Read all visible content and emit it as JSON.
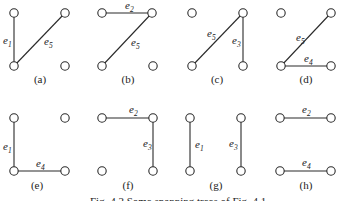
{
  "figure": {
    "caption": "Fig. 4.2   Some spanning trees of Fig. 4.1",
    "edge_color": "#2a2a2a",
    "panels": [
      {
        "label": "(a)",
        "nodes": [
          [
            14,
            13
          ],
          [
            65,
            13
          ],
          [
            14,
            66
          ],
          [
            65,
            66
          ]
        ],
        "edges": [
          {
            "name": "e",
            "sub": "1",
            "from": 0,
            "to": 2,
            "lx": 3,
            "ly": 44
          },
          {
            "name": "e",
            "sub": "5",
            "from": 2,
            "to": 1,
            "lx": 44,
            "ly": 45
          }
        ],
        "label_pos": [
          40,
          83
        ]
      },
      {
        "label": "(b)",
        "nodes": [
          [
            102,
            13
          ],
          [
            152,
            13
          ],
          [
            102,
            66
          ],
          [
            153,
            66
          ]
        ],
        "edges": [
          {
            "name": "e",
            "sub": "2",
            "from": 0,
            "to": 1,
            "lx": 125,
            "ly": 9
          },
          {
            "name": "e",
            "sub": "5",
            "from": 2,
            "to": 1,
            "lx": 131,
            "ly": 46
          }
        ],
        "label_pos": [
          128,
          83
        ]
      },
      {
        "label": "(c)",
        "nodes": [
          [
            192,
            13
          ],
          [
            243,
            13
          ],
          [
            192,
            66
          ],
          [
            243,
            66
          ]
        ],
        "edges": [
          {
            "name": "e",
            "sub": "5",
            "from": 2,
            "to": 1,
            "lx": 207,
            "ly": 37
          },
          {
            "name": "e",
            "sub": "3",
            "from": 1,
            "to": 3,
            "lx": 232,
            "ly": 44
          }
        ],
        "label_pos": [
          217,
          83
        ]
      },
      {
        "label": "(d)",
        "nodes": [
          [
            281,
            13
          ],
          [
            331,
            13
          ],
          [
            281,
            66
          ],
          [
            331,
            66
          ]
        ],
        "edges": [
          {
            "name": "e",
            "sub": "5",
            "from": 2,
            "to": 1,
            "lx": 296,
            "ly": 41
          },
          {
            "name": "e",
            "sub": "4",
            "from": 2,
            "to": 3,
            "lx": 304,
            "ly": 62
          }
        ],
        "label_pos": [
          306,
          83
        ]
      },
      {
        "label": "(e)",
        "nodes": [
          [
            14,
            118
          ],
          [
            65,
            118
          ],
          [
            14,
            171
          ],
          [
            65,
            171
          ]
        ],
        "edges": [
          {
            "name": "e",
            "sub": "1",
            "from": 0,
            "to": 2,
            "lx": 3,
            "ly": 150
          },
          {
            "name": "e",
            "sub": "4",
            "from": 2,
            "to": 3,
            "lx": 36,
            "ly": 167
          }
        ],
        "label_pos": [
          37,
          189
        ]
      },
      {
        "label": "(f)",
        "nodes": [
          [
            102,
            118
          ],
          [
            153,
            118
          ],
          [
            102,
            171
          ],
          [
            153,
            171
          ]
        ],
        "edges": [
          {
            "name": "e",
            "sub": "2",
            "from": 0,
            "to": 1,
            "lx": 129,
            "ly": 113
          },
          {
            "name": "e",
            "sub": "3",
            "from": 1,
            "to": 3,
            "lx": 143,
            "ly": 147
          }
        ],
        "label_pos": [
          128,
          189
        ]
      },
      {
        "label": "(g)",
        "nodes": [
          [
            190,
            118
          ],
          [
            241,
            118
          ],
          [
            190,
            171
          ],
          [
            241,
            171
          ]
        ],
        "edges": [
          {
            "name": "e",
            "sub": "1",
            "from": 0,
            "to": 2,
            "lx": 195,
            "ly": 148
          },
          {
            "name": "e",
            "sub": "3",
            "from": 1,
            "to": 3,
            "lx": 229,
            "ly": 147
          }
        ],
        "label_pos": [
          216,
          189
        ]
      },
      {
        "label": "(h)",
        "nodes": [
          [
            280,
            118
          ],
          [
            331,
            118
          ],
          [
            280,
            171
          ],
          [
            331,
            171
          ]
        ],
        "edges": [
          {
            "name": "e",
            "sub": "2",
            "from": 0,
            "to": 1,
            "lx": 302,
            "ly": 113
          },
          {
            "name": "e",
            "sub": "4",
            "from": 2,
            "to": 3,
            "lx": 302,
            "ly": 166
          }
        ],
        "label_pos": [
          306,
          189
        ]
      }
    ]
  }
}
